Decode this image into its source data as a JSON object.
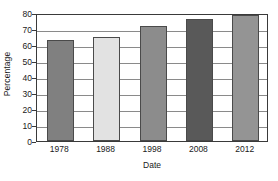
{
  "chart_data": {
    "type": "bar",
    "title": "",
    "xlabel": "Date",
    "ylabel": "Percentage",
    "categories": [
      "1978",
      "1988",
      "1998",
      "2008",
      "2012"
    ],
    "values": [
      63,
      65,
      72,
      76,
      79
    ],
    "bar_colors": [
      "#808080",
      "#e2e2e2",
      "#8c8c8c",
      "#595959",
      "#949494"
    ],
    "ylim": [
      0,
      80
    ],
    "ytick_step": 10,
    "yticks": [
      0,
      10,
      20,
      30,
      40,
      50,
      60,
      70,
      80
    ],
    "ytick_labels": [
      "0",
      "10",
      "20",
      "30",
      "40",
      "50",
      "60",
      "70",
      "80"
    ],
    "grid": true,
    "grid_axis": "y",
    "legend": false,
    "legend_position": "none",
    "frame": true,
    "axis_color": "#3a3a3a",
    "grid_color": "#8a8a8a",
    "background": "#ffffff"
  }
}
